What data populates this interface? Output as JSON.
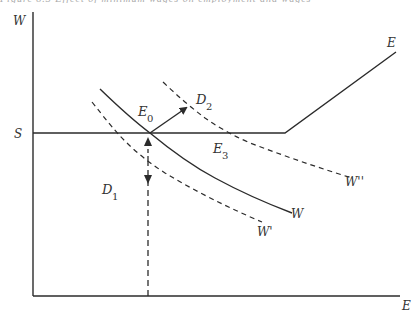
{
  "caption_cutoff": "Figure 8.3  Effect of minimum wages on employment and wages",
  "axes": {
    "y_label": "W",
    "x_label": "E"
  },
  "levels": {
    "s_label": "S"
  },
  "curves": {
    "e_curve_label": "E",
    "w_curve_label": "W",
    "w_prime_label": "W'",
    "w_double_prime_label": "W''",
    "d1_label": "D",
    "d1_sub": "1",
    "d2_label": "D",
    "d2_sub": "2"
  },
  "points": {
    "e0_label": "E",
    "e0_sub": "0",
    "e3_label": "E",
    "e3_sub": "3"
  },
  "colors": {
    "line": "#2b2b2b",
    "text": "#333333",
    "background": "#ffffff"
  }
}
